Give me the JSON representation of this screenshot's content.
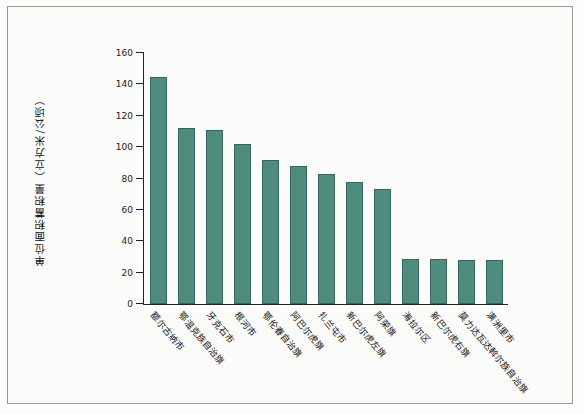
{
  "chart_data": {
    "type": "bar",
    "title": "",
    "xlabel": "",
    "ylabel": "单位面积蓄积量（立方米/公顷）",
    "ylim": [
      0,
      160
    ],
    "yticks": [
      0,
      20,
      40,
      60,
      80,
      100,
      120,
      140,
      160
    ],
    "grid": false,
    "legend": "none",
    "categories": [
      "额尔古纳市",
      "鄂温克族自治旗",
      "牙克石市",
      "根河市",
      "鄂伦春自治旗",
      "阿巴尔虎旗",
      "扎兰屯市",
      "新巴尔虎左旗",
      "阿荣旗",
      "海拉尔区",
      "新巴尔虎右旗",
      "莫力达瓦达斡尔族自治旗",
      "满洲里市"
    ],
    "values": [
      145,
      112,
      111,
      102,
      92,
      88,
      83,
      78,
      73,
      29,
      29,
      28,
      28
    ],
    "bar_color": "#4e8c7e"
  }
}
